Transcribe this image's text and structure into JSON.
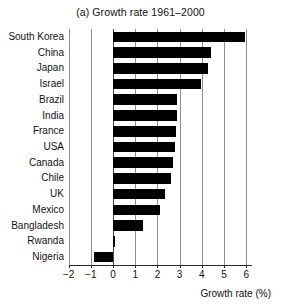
{
  "chart_data": {
    "type": "bar",
    "orientation": "horizontal",
    "title": "(a) Growth rate 1961–2000",
    "xlabel": "Growth rate (%)",
    "ylabel": "",
    "xlim": [
      -2,
      6.25
    ],
    "xticks": [
      -2,
      -1,
      0,
      1,
      2,
      3,
      4,
      5,
      6
    ],
    "xticklabels": [
      "−2",
      "−1",
      "0",
      "1",
      "2",
      "3",
      "4",
      "5",
      "6"
    ],
    "grid": "vertical",
    "legend": "none",
    "bar_color": "#000000",
    "categories": [
      "South Korea",
      "China",
      "Japan",
      "Israel",
      "Brazil",
      "India",
      "France",
      "USA",
      "Canada",
      "Chile",
      "UK",
      "Mexico",
      "Bangladesh",
      "Rwanda",
      "Nigeria"
    ],
    "values": [
      5.95,
      4.4,
      4.3,
      3.95,
      2.9,
      2.87,
      2.84,
      2.8,
      2.7,
      2.6,
      2.35,
      2.1,
      1.35,
      0.1,
      -0.85
    ]
  }
}
